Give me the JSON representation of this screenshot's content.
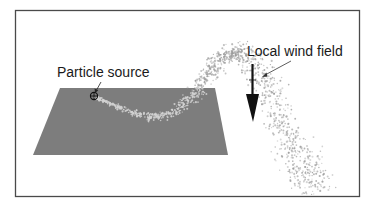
{
  "figure": {
    "type": "particle dispersion simulation illustration",
    "labels": {
      "source": "Particle source",
      "wind": "Local wind field"
    },
    "colors": {
      "background": "#ffffff",
      "frame": "#4a4a4a",
      "ground_plane": "#7d7d7d",
      "particles": "#9a9a9a",
      "wind_arrow": "#111111",
      "text": "#1a1a1a"
    },
    "elements": {
      "ground_plane": {
        "shape": "parallelogram",
        "corners": [
          [
            60,
            88
          ],
          [
            215,
            88
          ],
          [
            228,
            155
          ],
          [
            33,
            155
          ]
        ]
      },
      "particle_source": {
        "marker": "circled-cross",
        "position": [
          94,
          96
        ]
      },
      "wind_arrow": {
        "direction": "down",
        "from": [
          252,
          66
        ],
        "to": [
          252,
          120
        ]
      },
      "plume": {
        "description": "particles emitted from source drift right across the plane, rise upward, then bend down and to the right past the wind arrow"
      }
    }
  }
}
